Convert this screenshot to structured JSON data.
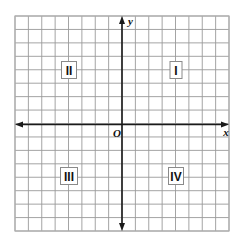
{
  "figure": {
    "grid": {
      "cols": 16,
      "rows": 16,
      "left": 15,
      "top": 16,
      "right": 229,
      "bottom": 231,
      "line_color": "#9a9a9a",
      "border_color": "#b0b0b0"
    },
    "axes": {
      "x_axis_y": 124.5,
      "y_axis_x": 122,
      "color": "#1a1a1a",
      "x_label": "x",
      "y_label": "y",
      "origin_label": "O"
    },
    "quadrants": [
      {
        "label": "I",
        "cx": 176,
        "cy": 70
      },
      {
        "label": "II",
        "cx": 69,
        "cy": 70
      },
      {
        "label": "III",
        "cx": 69,
        "cy": 176
      },
      {
        "label": "IV",
        "cx": 176,
        "cy": 176
      }
    ]
  },
  "chart_data": {
    "type": "scatter",
    "xlabel": "x",
    "ylabel": "y",
    "xlim": [
      -8,
      8
    ],
    "ylim": [
      -8,
      8
    ],
    "grid": true,
    "annotations": [
      {
        "text": "I",
        "x": 4,
        "y": 4
      },
      {
        "text": "II",
        "x": -4,
        "y": 4
      },
      {
        "text": "III",
        "x": -4,
        "y": -4
      },
      {
        "text": "IV",
        "x": 4,
        "y": -4
      },
      {
        "text": "O",
        "x": 0,
        "y": 0
      }
    ],
    "series": []
  }
}
